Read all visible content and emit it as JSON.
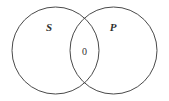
{
  "figure": {
    "type": "venn-diagram",
    "background_color": "#ffffff",
    "stroke_color": "#4a4a4a",
    "text_color": "#30302f",
    "width": 169,
    "height": 101,
    "sets": [
      {
        "id": "left",
        "label": "S",
        "label_x": 49,
        "label_y": 31,
        "center_x": 55.5,
        "center_y": 50.5,
        "radius": 43.5
      },
      {
        "id": "right",
        "label": "P",
        "label_x": 113,
        "label_y": 31,
        "center_x": 113.5,
        "center_y": 50.5,
        "radius": 43.5
      }
    ],
    "regions": [
      {
        "id": "intersection",
        "label": "0",
        "label_x": 84.5,
        "label_y": 55
      }
    ]
  }
}
